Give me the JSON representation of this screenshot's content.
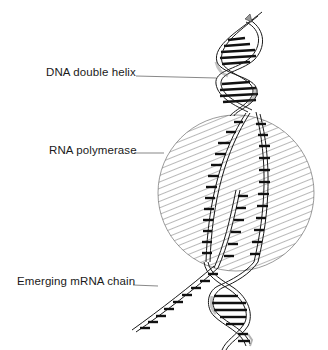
{
  "diagram": {
    "type": "labeled-illustration",
    "labels": [
      {
        "id": "dna",
        "text": "DNA double helix"
      },
      {
        "id": "rna",
        "text": "RNA polymerase"
      },
      {
        "id": "mrna",
        "text": "Emerging mRNA chain"
      }
    ],
    "colors": {
      "ink": "#1a1a1a",
      "background": "#ffffff"
    }
  }
}
